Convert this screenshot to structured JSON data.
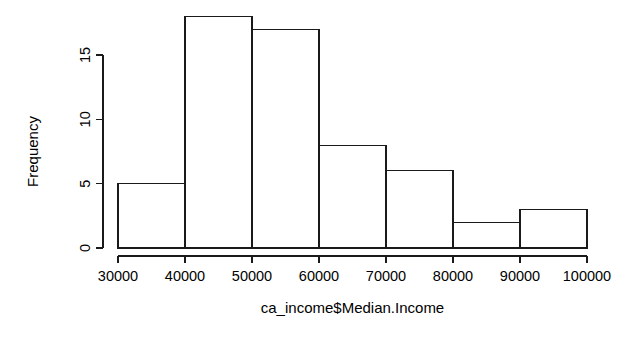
{
  "chart_data": {
    "type": "bar",
    "chart_subtype": "histogram",
    "title": "",
    "xlabel": "ca_income$Median.Income",
    "ylabel": "Frequency",
    "grid": false,
    "legend": false,
    "legend_position": "none",
    "bin_width": 10000,
    "bin_edges": [
      30000,
      40000,
      50000,
      60000,
      70000,
      80000,
      90000,
      100000
    ],
    "categories": [
      "30000-40000",
      "40000-50000",
      "50000-60000",
      "60000-70000",
      "70000-80000",
      "80000-90000",
      "90000-100000"
    ],
    "values": [
      5,
      18,
      17,
      8,
      6,
      2,
      3
    ],
    "xlim": [
      30000,
      100000
    ],
    "ylim": [
      0,
      18
    ],
    "x_ticks": [
      30000,
      40000,
      50000,
      60000,
      70000,
      80000,
      90000,
      100000
    ],
    "x_tick_labels": [
      "30000",
      "40000",
      "50000",
      "60000",
      "70000",
      "80000",
      "90000",
      "100000"
    ],
    "y_ticks": [
      0,
      5,
      10,
      15
    ],
    "y_tick_labels": [
      "0",
      "5",
      "10",
      "15"
    ],
    "y_axis_range_drawn": [
      0,
      15
    ],
    "total_count": 59,
    "colors": {
      "bar_fill": "#ffffff",
      "bar_stroke": "#1a1a1a",
      "axis": "#1a1a1a",
      "text": "#000000",
      "background": "#ffffff"
    }
  },
  "plot": {
    "geometry": {
      "width": 643,
      "height": 341,
      "plot_left": 118,
      "plot_right": 587,
      "baseline_y": 248,
      "y_axis_top_y": 55,
      "x_axis_y": 256,
      "px_per_unit_y": 12.87,
      "px_per_10000_x": 67
    }
  }
}
